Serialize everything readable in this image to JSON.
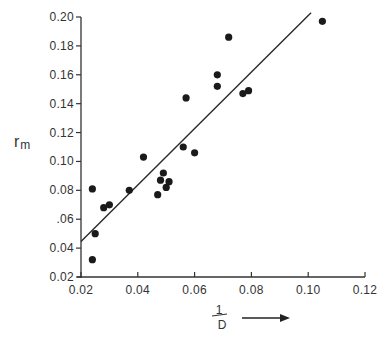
{
  "chart_data": {
    "type": "scatter",
    "title": "",
    "xlabel": "1/D",
    "xlabel_numerator": "1",
    "xlabel_denominator": "D",
    "xlabel_arrow": "→",
    "ylabel": "r_m",
    "ylabel_main": "r",
    "ylabel_sub": "m",
    "xlim": [
      0.02,
      0.12
    ],
    "ylim": [
      0.02,
      0.2
    ],
    "x_ticks": [
      0.02,
      0.04,
      0.06,
      0.08,
      0.1,
      0.12
    ],
    "x_tick_labels": [
      "0.02",
      "0.04",
      "0.06",
      "0.08",
      "0.10",
      "0.12"
    ],
    "y_ticks": [
      0.02,
      0.04,
      0.06,
      0.08,
      0.1,
      0.12,
      0.14,
      0.16,
      0.18,
      0.2
    ],
    "y_tick_labels": [
      "0.02",
      "0.04",
      ".06",
      "0.08",
      "0.10",
      "0.12",
      "0.14",
      "0.16",
      "0.18",
      "0.20"
    ],
    "grid": false,
    "legend": null,
    "series": [
      {
        "name": "observations",
        "points": [
          {
            "x": 0.024,
            "y": 0.081
          },
          {
            "x": 0.025,
            "y": 0.05
          },
          {
            "x": 0.024,
            "y": 0.032
          },
          {
            "x": 0.028,
            "y": 0.068
          },
          {
            "x": 0.03,
            "y": 0.07
          },
          {
            "x": 0.037,
            "y": 0.08
          },
          {
            "x": 0.042,
            "y": 0.103
          },
          {
            "x": 0.047,
            "y": 0.077
          },
          {
            "x": 0.048,
            "y": 0.087
          },
          {
            "x": 0.049,
            "y": 0.092
          },
          {
            "x": 0.05,
            "y": 0.082
          },
          {
            "x": 0.051,
            "y": 0.086
          },
          {
            "x": 0.056,
            "y": 0.11
          },
          {
            "x": 0.057,
            "y": 0.144
          },
          {
            "x": 0.06,
            "y": 0.106
          },
          {
            "x": 0.068,
            "y": 0.152
          },
          {
            "x": 0.068,
            "y": 0.16
          },
          {
            "x": 0.072,
            "y": 0.186
          },
          {
            "x": 0.077,
            "y": 0.147
          },
          {
            "x": 0.079,
            "y": 0.149
          },
          {
            "x": 0.105,
            "y": 0.197
          }
        ]
      }
    ],
    "regression_line": {
      "x1": 0.02,
      "y1": 0.0445,
      "x2": 0.101,
      "y2": 0.203
    }
  }
}
